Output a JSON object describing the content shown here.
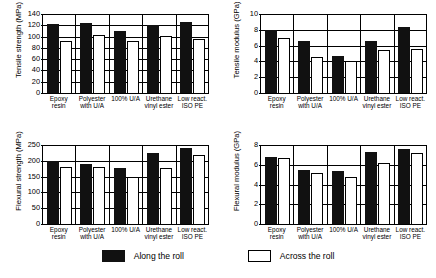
{
  "figure": {
    "panel_order": [
      "tensile_strength",
      "tensile_modulus",
      "flexural_strength",
      "flexural_modulus"
    ]
  },
  "legend": {
    "items": [
      {
        "label": "Along the roll",
        "swatch": "filled-black-square",
        "color": "#111111"
      },
      {
        "label": "Across the roll",
        "swatch": "outlined-white-square",
        "color": "#ffffff"
      }
    ]
  },
  "chart_data": [
    {
      "id": "tensile_strength",
      "type": "bar",
      "title": "",
      "xlabel": "",
      "ylabel": "Tensile strength (MPa)",
      "ylim": [
        0,
        140
      ],
      "yticks": [
        0,
        20,
        40,
        60,
        80,
        100,
        120,
        140
      ],
      "grid": true,
      "legend_position": "bottom",
      "categories": [
        "Epoxy\nresin",
        "Polyester\nwith U/A",
        "100% U/A",
        "Urethane\nvinyl ester",
        "Low react.\nISO PE"
      ],
      "series": [
        {
          "name": "Along the roll",
          "values": [
            122,
            124,
            110,
            121,
            126
          ]
        },
        {
          "name": "Across the roll",
          "values": [
            93,
            102,
            93,
            101,
            96
          ]
        }
      ]
    },
    {
      "id": "tensile_modulus",
      "type": "bar",
      "title": "",
      "xlabel": "",
      "ylabel": "Tensile modulus (GPa)",
      "ylim": [
        0,
        10
      ],
      "yticks": [
        0,
        2,
        4,
        6,
        8,
        10
      ],
      "grid": true,
      "legend_position": "bottom",
      "categories": [
        "Epoxy\nresin",
        "Polyester\nwith U/A",
        "100% U/A",
        "Urethane\nvinyl ester",
        "Low react.\nISO PE"
      ],
      "series": [
        {
          "name": "Along the roll",
          "values": [
            8.0,
            6.55,
            4.7,
            6.55,
            8.35
          ]
        },
        {
          "name": "Across the roll",
          "values": [
            7.0,
            4.6,
            4.0,
            5.4,
            5.6
          ]
        }
      ]
    },
    {
      "id": "flexural_strength",
      "type": "bar",
      "title": "",
      "xlabel": "",
      "ylabel": "Flexural strength (MPa)",
      "ylim": [
        0,
        250
      ],
      "yticks": [
        0,
        50,
        100,
        150,
        200,
        250
      ],
      "grid": true,
      "legend_position": "bottom",
      "categories": [
        "Epoxy\nresin",
        "Polyester\nwith U/A",
        "100% U/A",
        "Urethane\nvinyl ester",
        "Low react.\nISO PE"
      ],
      "series": [
        {
          "name": "Along the roll",
          "values": [
            200,
            190,
            176,
            224,
            240
          ]
        },
        {
          "name": "Across the roll",
          "values": [
            180,
            180,
            150,
            178,
            218
          ]
        }
      ]
    },
    {
      "id": "flexural_modulus",
      "type": "bar",
      "title": "",
      "xlabel": "",
      "ylabel": "Flexural modulus (GPa)",
      "ylim": [
        0,
        8
      ],
      "yticks": [
        0,
        2,
        4,
        6,
        8
      ],
      "grid": true,
      "legend_position": "bottom",
      "categories": [
        "Epoxy\nresin",
        "Polyester\nwith U/A",
        "100% U/A",
        "Urethane\nvinyl ester",
        "Low react.\nISO PE"
      ],
      "series": [
        {
          "name": "Along the roll",
          "values": [
            6.8,
            5.5,
            5.4,
            7.3,
            7.55
          ]
        },
        {
          "name": "Across the roll",
          "values": [
            6.7,
            5.2,
            4.75,
            6.2,
            7.2
          ]
        }
      ]
    }
  ]
}
